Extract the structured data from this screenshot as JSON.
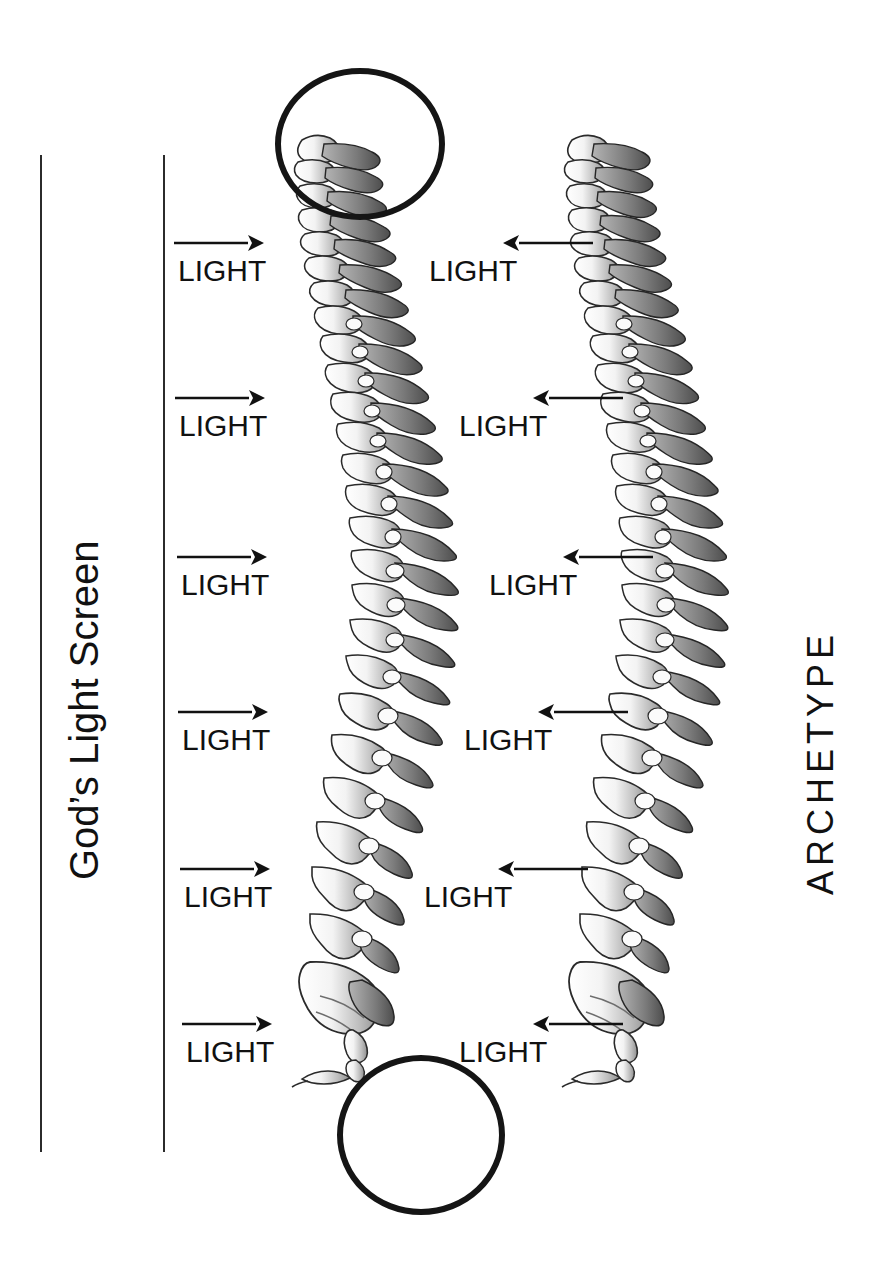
{
  "figure": {
    "background_color": "#ffffff",
    "ink_color": "#111111",
    "ring_color": "#151515"
  },
  "left_caption": {
    "text": "God’s Light Screen",
    "orientation": "rotated-90-ccw"
  },
  "right_caption": {
    "text": "ARCHETYPE",
    "orientation": "rotated-90-ccw"
  },
  "rules": [
    {
      "name": "outer-rule"
    },
    {
      "name": "inner-rule"
    }
  ],
  "left_lights": [
    {
      "label": "LIGHT",
      "direction": "right"
    },
    {
      "label": "LIGHT",
      "direction": "right"
    },
    {
      "label": "LIGHT",
      "direction": "right"
    },
    {
      "label": "LIGHT",
      "direction": "right"
    },
    {
      "label": "LIGHT",
      "direction": "right"
    },
    {
      "label": "LIGHT",
      "direction": "right"
    }
  ],
  "right_lights": [
    {
      "label": "LIGHT",
      "direction": "left"
    },
    {
      "label": "LIGHT",
      "direction": "left"
    },
    {
      "label": "LIGHT",
      "direction": "left"
    },
    {
      "label": "LIGHT",
      "direction": "left"
    },
    {
      "label": "LIGHT",
      "direction": "left"
    },
    {
      "label": "LIGHT",
      "direction": "left"
    }
  ],
  "rings": [
    {
      "name": "cervical-highlight-ring",
      "target": "upper cervical vertebrae"
    },
    {
      "name": "coccyx-highlight-ring",
      "target": "sacrum and coccyx"
    }
  ],
  "spines": [
    {
      "name": "left-spine",
      "description": "lateral view human vertebral column"
    },
    {
      "name": "right-spine",
      "description": "lateral view human vertebral column"
    }
  ]
}
